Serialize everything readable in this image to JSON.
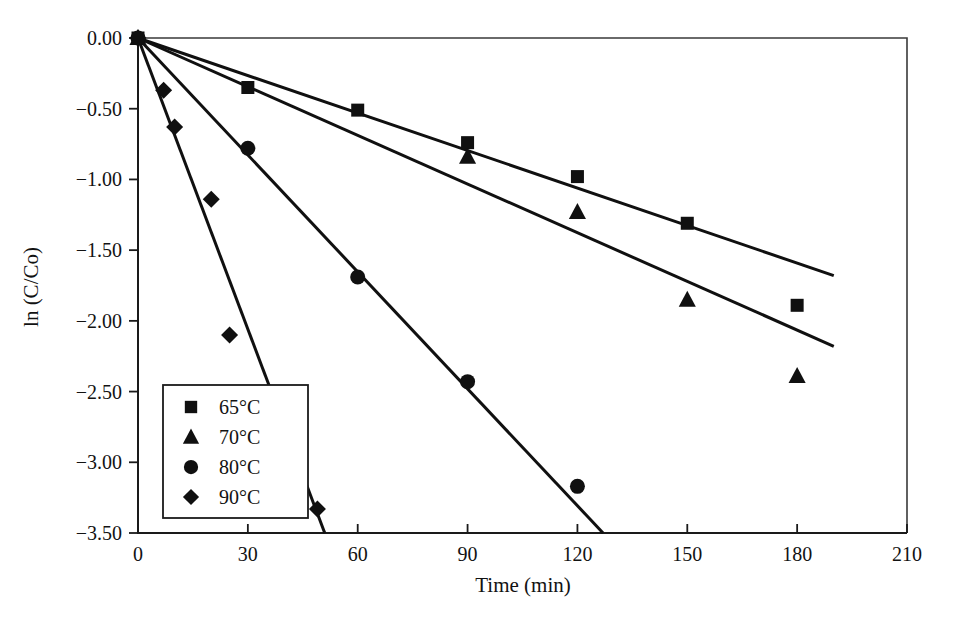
{
  "chart_data": {
    "type": "scatter",
    "title": "",
    "xlabel": "Time (min)",
    "ylabel": "ln (C/Co)",
    "xlim": [
      0,
      210
    ],
    "ylim": [
      -3.5,
      0.0
    ],
    "xticks": [
      0,
      30,
      60,
      90,
      120,
      150,
      180,
      210
    ],
    "xtick_labels": [
      "0",
      "30",
      "60",
      "90",
      "120",
      "150",
      "180",
      "210"
    ],
    "yticks": [
      0.0,
      -0.5,
      -1.0,
      -1.5,
      -2.0,
      -2.5,
      -3.0,
      -3.5
    ],
    "ytick_labels": [
      "0.00",
      "-0.50",
      "-1.00",
      "-1.50",
      "-2.00",
      "-2.50",
      "-3.00",
      "-3.50"
    ],
    "grid": false,
    "legend_position": "lower-left",
    "marker_color": "#101010",
    "line_color": "#101010",
    "series": [
      {
        "name": "65°C",
        "marker": "square",
        "x": [
          0,
          30,
          60,
          90,
          120,
          150,
          180
        ],
        "y": [
          0.0,
          -0.35,
          -0.51,
          -0.74,
          -0.98,
          -1.31,
          -1.89
        ],
        "fit_line": {
          "x": [
            0,
            190
          ],
          "y": [
            0.0,
            -1.68
          ]
        }
      },
      {
        "name": "70°C",
        "marker": "triangle",
        "x": [
          0,
          90,
          120,
          150,
          180
        ],
        "y": [
          0.0,
          -0.84,
          -1.23,
          -1.85,
          -2.39
        ],
        "fit_line": {
          "x": [
            0,
            190
          ],
          "y": [
            0.0,
            -2.18
          ]
        }
      },
      {
        "name": "80°C",
        "marker": "circle",
        "x": [
          0,
          30,
          60,
          90,
          120
        ],
        "y": [
          0.0,
          -0.78,
          -1.69,
          -2.43,
          -3.17
        ],
        "fit_line": {
          "x": [
            0,
            127
          ],
          "y": [
            0.0,
            -3.5
          ]
        }
      },
      {
        "name": "90°C",
        "marker": "diamond",
        "x": [
          0,
          7,
          10,
          20,
          25,
          49
        ],
        "y": [
          0.0,
          -0.37,
          -0.63,
          -1.14,
          -2.1,
          -3.33
        ],
        "fit_line": {
          "x": [
            0,
            51
          ],
          "y": [
            0.0,
            -3.5
          ]
        }
      }
    ],
    "legend": [
      {
        "label": "65°C",
        "marker": "square"
      },
      {
        "label": "70°C",
        "marker": "triangle"
      },
      {
        "label": "80°C",
        "marker": "circle"
      },
      {
        "label": "90°C",
        "marker": "diamond"
      }
    ]
  }
}
